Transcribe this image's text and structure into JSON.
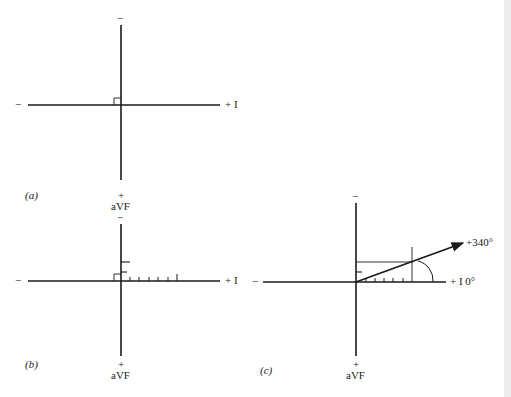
{
  "figure": {
    "panels": [
      {
        "id": "a",
        "caption": "(a)",
        "axis_top_sign": "−",
        "axis_left_sign": "−",
        "axis_right_label": "+ I",
        "axis_bottom_sign": "+",
        "axis_bottom_label": "aVF"
      },
      {
        "id": "b",
        "caption": "(b)",
        "axis_top_sign": "−",
        "axis_left_sign": "−",
        "axis_right_label": "+ I",
        "axis_bottom_sign": "+",
        "axis_bottom_label": "aVF",
        "lead_I_ticks": 6,
        "lead_aVF_ticks": 2
      },
      {
        "id": "c",
        "caption": "(c)",
        "axis_top_sign": "−",
        "axis_left_sign": "−",
        "axis_right_label": "+ I 0°",
        "axis_bottom_sign": "+",
        "axis_bottom_label": "aVF",
        "vector_label": "+340°",
        "lead_I_ticks": 6,
        "lead_aVF_ticks": 2
      }
    ]
  }
}
